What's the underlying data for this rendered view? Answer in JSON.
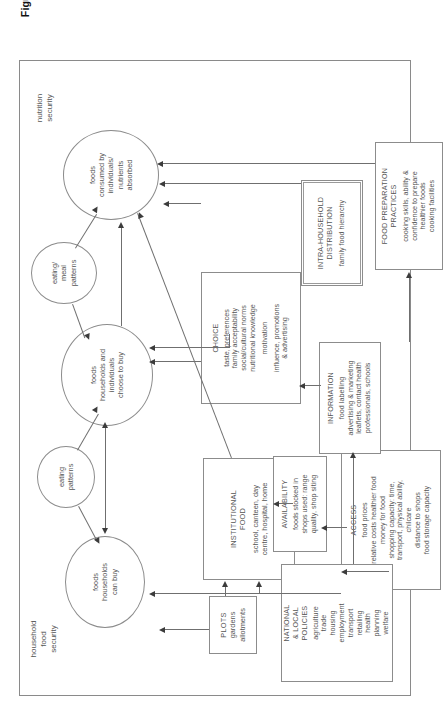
{
  "figure": {
    "caption_main": "Figure 2.1: Determinants of food and nutrition security in the UK",
    "caption_source": "(modified from Department of Health, 1996)"
  },
  "zone_labels": {
    "household": "household\nfood\nsecurity",
    "household_l1": "household",
    "household_l2": "food",
    "household_l3": "security",
    "nutrition_l1": "nutrition",
    "nutrition_l2": "security"
  },
  "ellipses": [
    {
      "id": "foods-households-can-buy",
      "lines": [
        "foods",
        "households",
        "can buy"
      ]
    },
    {
      "id": "eating-patterns",
      "lines": [
        "eating",
        "patterns"
      ]
    },
    {
      "id": "foods-households-individuals-choose-to-buy",
      "lines": [
        "foods",
        "households and",
        "individuals",
        "choose to buy"
      ]
    },
    {
      "id": "eating-meal-patterns",
      "lines": [
        "eating/",
        "meal",
        "patterns"
      ]
    },
    {
      "id": "foods-consumed-absorbed",
      "lines": [
        "foods",
        "consumed by",
        "individuals/",
        "nutrients",
        "absorbed"
      ]
    }
  ],
  "boxes": [
    {
      "id": "plots",
      "title": "PLOTS",
      "lines": [
        "gardens",
        "allotments"
      ]
    },
    {
      "id": "institutional-food",
      "title": "INSTITUTIONAL",
      "title2": "FOOD",
      "lines": [
        "school, canteen, day",
        "centre, hospital, home"
      ]
    },
    {
      "id": "access",
      "title": "ACCESS",
      "lines": [
        "food prices",
        "relative costs healthier food",
        "money for food",
        "shopping capacity: time,",
        "transport, physical ability,",
        "chilcare",
        "distance to shops",
        "food storage capacity"
      ]
    },
    {
      "id": "availability",
      "title": "AVAILABILITY",
      "lines": [
        "foods stocked in",
        "shops used: range",
        "quality, shop siting"
      ]
    },
    {
      "id": "national-local-policies",
      "title": "NATIONAL",
      "title2": "& LOCAL",
      "title3": "POLICIES",
      "lines": [
        "agriculture",
        "trade",
        "housing",
        "employment",
        "transport",
        "retailing",
        "health",
        "planning",
        "welfare"
      ]
    },
    {
      "id": "information",
      "title": "INFORMATION",
      "lines": [
        "food labelling",
        "advertising & marketing",
        "leaflets, contact health",
        "professionals, schools"
      ]
    },
    {
      "id": "choice",
      "title": "CHOICE",
      "lines": [
        "taste, preferences",
        "family acceptability",
        "social/cultural norms",
        "nutritional knowledge",
        "motivation",
        "influence, promotions",
        "& advertising"
      ]
    },
    {
      "id": "intra-household-distribution",
      "title": "INTRA-HOUSEHOLD",
      "title2": "DISTRIBUTION",
      "lines": [
        "family food hierarchy"
      ]
    },
    {
      "id": "food-preparation-practices",
      "title": "FOOD PREPARATION",
      "title2": "PRACTICES",
      "lines": [
        "cooking skills, ability &",
        "confidence to prepare",
        "healthier foods",
        "cooking facilities"
      ]
    }
  ],
  "colors": {
    "stroke": "#8c8c8c",
    "arrow": "#3c3c3c",
    "text": "#555555",
    "caption": "#111111",
    "background": "#ffffff"
  }
}
